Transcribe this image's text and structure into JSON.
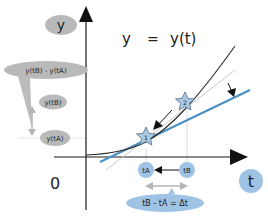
{
  "title": {
    "lhs": "y",
    "eq": "=",
    "rhs": "y(t)"
  },
  "axes": {
    "y_label": "y",
    "x_label": "t",
    "origin_label": "0"
  },
  "y_labels": {
    "difference": "y(tB) - y(tA)",
    "yB": "y(tB)",
    "yA": "y(tA)"
  },
  "t_labels": {
    "tA": "tA",
    "tB": "tB",
    "delta": "tB - tA = Δt"
  },
  "points": [
    {
      "id": "1",
      "label": "1"
    },
    {
      "id": "2",
      "label": "2"
    }
  ],
  "colors": {
    "axis": "#1a1a1a",
    "curve": "#2a2a2a",
    "tangent": "#4a8fc4",
    "secant": "#c8c8c8",
    "gray_bubble": "#b9b9b9",
    "blue_bubble": "#9ec3e4",
    "star_fill": "#a9c9e2",
    "guide": "#d9d9d9",
    "arrow_gray": "#b5b5b5"
  }
}
